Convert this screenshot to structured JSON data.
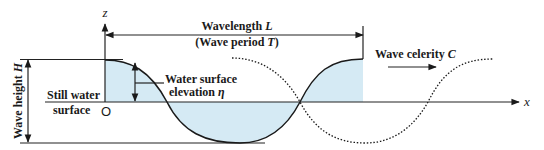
{
  "diagram": {
    "axes": {
      "z_label": "z",
      "x_label": "x",
      "origin_label": "O"
    },
    "wavelength": {
      "label": "Wavelength ",
      "symbol": "L",
      "period_open": "(Wave period ",
      "period_symbol": "T",
      "period_close": ")"
    },
    "celerity": {
      "label": "Wave celerity ",
      "symbol": "C"
    },
    "elevation": {
      "line1": "Water surface",
      "line2": "elevation ",
      "symbol": "η"
    },
    "still_water": {
      "line1": "Still water",
      "line2": "surface"
    },
    "wave_height": {
      "label": "Wave height ",
      "symbol": "H"
    },
    "colors": {
      "water_fill": "#d5eaf4",
      "line": "#1a1a1a"
    }
  }
}
